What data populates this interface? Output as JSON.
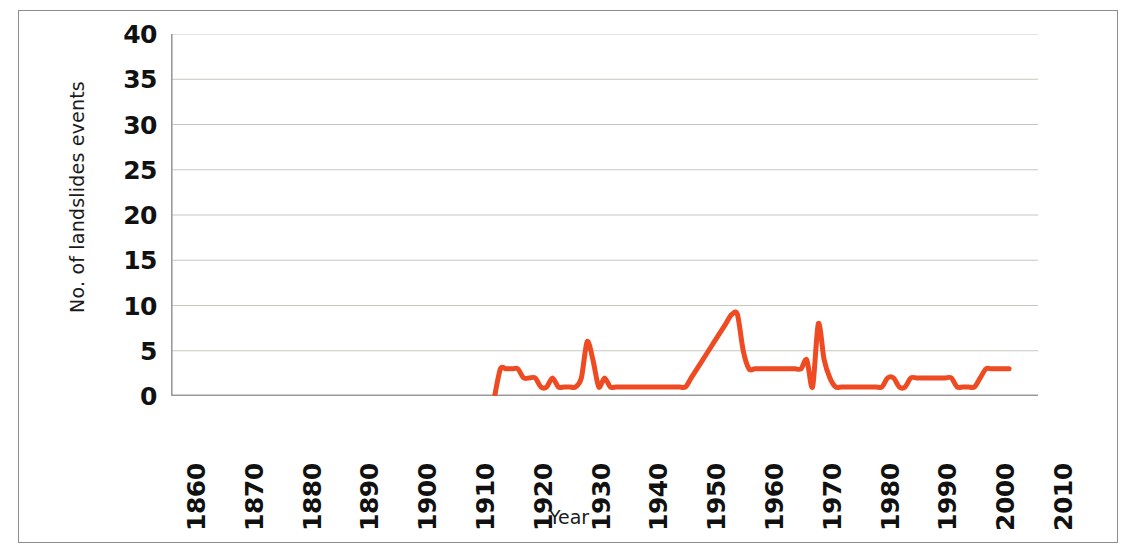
{
  "chart_data": {
    "type": "line",
    "title": "",
    "xlabel": "Year",
    "ylabel": "No. of landslides events",
    "xlim": [
      1860,
      2010
    ],
    "ylim": [
      0,
      40
    ],
    "xticks": [
      1860,
      1870,
      1880,
      1890,
      1900,
      1910,
      1920,
      1930,
      1940,
      1950,
      1960,
      1970,
      1980,
      1990,
      2000,
      2010
    ],
    "yticks": [
      0,
      5,
      10,
      15,
      20,
      25,
      30,
      35,
      40
    ],
    "grid": "horizontal",
    "legend": "none",
    "line_color": "#ee4b23",
    "line_width": 5,
    "series": [
      {
        "name": "No. of landslides events",
        "x": [
          1916,
          1917,
          1918,
          1919,
          1920,
          1921,
          1922,
          1923,
          1924,
          1925,
          1926,
          1927,
          1928,
          1929,
          1930,
          1931,
          1932,
          1933,
          1934,
          1935,
          1936,
          1937,
          1938,
          1939,
          1940,
          1941,
          1942,
          1943,
          1944,
          1945,
          1946,
          1947,
          1948,
          1949,
          1950,
          1951,
          1952,
          1953,
          1954,
          1955,
          1956,
          1957,
          1958,
          1959,
          1960,
          1961,
          1962,
          1963,
          1964,
          1965,
          1966,
          1967,
          1968,
          1969,
          1970,
          1971,
          1972,
          1973,
          1974,
          1975,
          1976,
          1977,
          1978,
          1979,
          1980,
          1981,
          1982,
          1983,
          1984,
          1985,
          1986,
          1987,
          1988,
          1989,
          1990,
          1991,
          1992,
          1993,
          1994,
          1995,
          1996,
          1997,
          1998,
          1999,
          2000,
          2001,
          2002,
          2003,
          2004,
          2005
        ],
        "values": [
          0,
          3,
          3,
          3,
          3,
          2,
          2,
          2,
          1,
          1,
          2,
          1,
          1,
          1,
          1,
          2,
          6,
          4,
          1,
          2,
          1,
          1,
          1,
          1,
          1,
          1,
          1,
          1,
          1,
          1,
          1,
          1,
          1,
          1,
          2,
          3,
          4,
          5,
          6,
          7,
          8,
          9,
          9,
          5,
          3,
          3,
          3,
          3,
          3,
          3,
          3,
          3,
          3,
          3,
          4,
          1,
          8,
          4,
          2,
          1,
          1,
          1,
          1,
          1,
          1,
          1,
          1,
          1,
          2,
          2,
          1,
          1,
          2,
          2,
          2,
          2,
          2,
          2,
          2,
          2,
          1,
          1,
          1,
          1,
          2,
          3,
          3,
          3,
          3,
          3
        ]
      }
    ]
  },
  "axis": {
    "y_title": "No. of landslides events",
    "x_title": "Year",
    "y_tick_labels": [
      "40",
      "35",
      "30",
      "25",
      "20",
      "15",
      "10",
      "5",
      "0"
    ],
    "x_tick_labels": [
      "1860",
      "1870",
      "1880",
      "1890",
      "1900",
      "1910",
      "1920",
      "1930",
      "1940",
      "1950",
      "1960",
      "1970",
      "1980",
      "1990",
      "2000",
      "2010"
    ]
  }
}
